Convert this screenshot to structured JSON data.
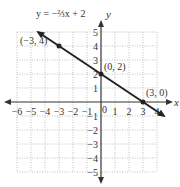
{
  "chart_data": {
    "type": "line",
    "title": "",
    "equation_label": "y = −⅔x + 2",
    "xlabel": "x",
    "ylabel": "y",
    "xlim": [
      -6,
      4
    ],
    "ylim": [
      -5,
      5
    ],
    "grid": true,
    "x_ticks": [
      -6,
      -5,
      -4,
      -3,
      -2,
      -1,
      1,
      2,
      3,
      4
    ],
    "x_tick_labels": [
      "−6",
      "−5",
      "−4",
      "−3",
      "−2",
      "−1",
      "1",
      "2",
      "3",
      "4"
    ],
    "y_ticks": [
      5,
      4,
      3,
      2,
      1,
      -1,
      -2,
      -3,
      -4,
      -5
    ],
    "y_tick_labels": [
      "5",
      "4",
      "3",
      "2",
      "1",
      "−1",
      "−2",
      "−3",
      "−4",
      "−5"
    ],
    "origin_label": "0",
    "series": [
      {
        "name": "y = -2/3 x + 2",
        "slope": -0.6667,
        "intercept": 2,
        "x_range": [
          -4.5,
          4.5
        ],
        "color": "#222222"
      }
    ],
    "points": [
      {
        "x": -3,
        "y": 4,
        "label": "(−3, 4)"
      },
      {
        "x": 0,
        "y": 2,
        "label": "(0, 2)"
      },
      {
        "x": 3,
        "y": 0,
        "label": "(3, 0)"
      }
    ],
    "colors": {
      "line": "#222222",
      "axis": "#333333",
      "grid": "#b0b0b0"
    }
  }
}
